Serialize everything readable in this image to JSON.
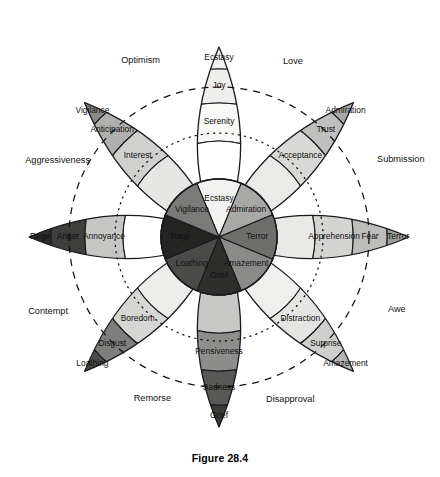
{
  "figure": {
    "caption": "Figure 28.4",
    "center": {
      "x": 219,
      "y": 237
    },
    "stroke_color": "#1a1a1a"
  },
  "palette": {
    "tip_white": "#ffffff",
    "joy_l1": "#f4f4f2",
    "joy_l2": "#eeeeec",
    "joy_l3": "#f2f2f0",
    "trust_l1": "#d8d8d6",
    "trust_l2": "#bfbfbd",
    "trust_l3": "#a8a8a6",
    "fear_l1": "#d4d4d2",
    "fear_l2": "#bdbdbb",
    "fear_l3": "#9c9c9a",
    "surprise_l1": "#e4e4e2",
    "surprise_l2": "#cfcfcd",
    "surprise_l3": "#b4b4b2",
    "sadness_l1": "#c8c8c6",
    "sadness_l2": "#8d8d8b",
    "sadness_l3": "#4f4f4d",
    "disgust_l1": "#e2e2e0",
    "disgust_l2": "#cccccb",
    "disgust_l3": "#7e7e7c",
    "anger_l1": "#c6c6c4",
    "anger_l2": "#3e3e3c",
    "anger_l3": "#2b2b29",
    "anticipation_l1": "#d0d0ce",
    "anticipation_l2": "#b0b0ae",
    "anticipation_l3": "#8a8a88"
  },
  "petals": [
    {
      "key": "joy",
      "angle_deg": -90,
      "primary": "Joy",
      "bands": [
        {
          "name": "Ecstasy",
          "level": 3,
          "color": "#f2f2f0",
          "text_color": "#111"
        },
        {
          "name": "Joy",
          "level": 2,
          "color": "#eeeeec",
          "text_color": "#111"
        },
        {
          "name": "Serenity",
          "level": 1,
          "color": "#f8f8f6",
          "text_color": "#111"
        },
        {
          "name": "",
          "level": 0,
          "color": "#ffffff",
          "text_color": "#111"
        }
      ]
    },
    {
      "key": "trust",
      "angle_deg": -45,
      "primary": "Trust",
      "bands": [
        {
          "name": "Admiration",
          "level": 3,
          "color": "#a8a8a6",
          "text_color": "#111"
        },
        {
          "name": "Trust",
          "level": 2,
          "color": "#bfbfbd",
          "text_color": "#111"
        },
        {
          "name": "Acceptance",
          "level": 1,
          "color": "#d8d8d6",
          "text_color": "#111"
        },
        {
          "name": "",
          "level": 0,
          "color": "#eaeae8",
          "text_color": "#111"
        }
      ]
    },
    {
      "key": "fear",
      "angle_deg": 0,
      "primary": "Fear",
      "bands": [
        {
          "name": "Terror",
          "level": 3,
          "color": "#9c9c9a",
          "text_color": "#111"
        },
        {
          "name": "Fear",
          "level": 2,
          "color": "#bdbdbb",
          "text_color": "#111"
        },
        {
          "name": "Apprehension",
          "level": 1,
          "color": "#d4d4d2",
          "text_color": "#111"
        },
        {
          "name": "",
          "level": 0,
          "color": "#e8e8e6",
          "text_color": "#111"
        }
      ]
    },
    {
      "key": "surprise",
      "angle_deg": 45,
      "primary": "Surprise",
      "bands": [
        {
          "name": "Amazement",
          "level": 3,
          "color": "#b4b4b2",
          "text_color": "#111"
        },
        {
          "name": "Surprise",
          "level": 2,
          "color": "#cfcfcd",
          "text_color": "#111"
        },
        {
          "name": "Distraction",
          "level": 1,
          "color": "#e4e4e2",
          "text_color": "#111"
        },
        {
          "name": "",
          "level": 0,
          "color": "#efefed",
          "text_color": "#111"
        }
      ]
    },
    {
      "key": "sadness",
      "angle_deg": 90,
      "primary": "Sadness",
      "bands": [
        {
          "name": "Grief",
          "level": 3,
          "color": "#3a3a38",
          "text_color": "#f0f0f0"
        },
        {
          "name": "Sadness",
          "level": 2,
          "color": "#585856",
          "text_color": "#f0f0f0"
        },
        {
          "name": "Pensiveness",
          "level": 1,
          "color": "#8d8d8b",
          "text_color": "#111"
        },
        {
          "name": "",
          "level": 0,
          "color": "#c8c8c6",
          "text_color": "#111"
        }
      ]
    },
    {
      "key": "disgust",
      "angle_deg": 135,
      "primary": "Disgust",
      "bands": [
        {
          "name": "Loathing",
          "level": 3,
          "color": "#4a4a48",
          "text_color": "#f0f0f0"
        },
        {
          "name": "Disgust",
          "level": 2,
          "color": "#7e7e7c",
          "text_color": "#111"
        },
        {
          "name": "Boredom",
          "level": 1,
          "color": "#d6d6d4",
          "text_color": "#111"
        },
        {
          "name": "",
          "level": 0,
          "color": "#ededeb",
          "text_color": "#111"
        }
      ]
    },
    {
      "key": "anger",
      "angle_deg": 180,
      "primary": "Anger",
      "bands": [
        {
          "name": "Rage",
          "level": 3,
          "color": "#2b2b29",
          "text_color": "#e8e8e8"
        },
        {
          "name": "Anger",
          "level": 2,
          "color": "#3e3e3c",
          "text_color": "#e8e8e8"
        },
        {
          "name": "Annoyance",
          "level": 1,
          "color": "#c6c6c4",
          "text_color": "#111"
        },
        {
          "name": "",
          "level": 0,
          "color": "#ffffff",
          "text_color": "#111"
        }
      ]
    },
    {
      "key": "anticipation",
      "angle_deg": -135,
      "primary": "Anticipation",
      "bands": [
        {
          "name": "Vigilance",
          "level": 3,
          "color": "#8a8a88",
          "text_color": "#111"
        },
        {
          "name": "Anticipation",
          "level": 2,
          "color": "#b0b0ae",
          "text_color": "#111"
        },
        {
          "name": "Interest",
          "level": 1,
          "color": "#d0d0ce",
          "text_color": "#111"
        },
        {
          "name": "",
          "level": 0,
          "color": "#e6e6e4",
          "text_color": "#111"
        }
      ]
    }
  ],
  "core_segments": [
    {
      "name": "Ecstasy",
      "angle_deg": -90,
      "color": "#f2f2f0",
      "text_color": "#111"
    },
    {
      "name": "Admiration",
      "angle_deg": -45,
      "color": "#a8a8a6",
      "text_color": "#111"
    },
    {
      "name": "Terror",
      "angle_deg": 0,
      "color": "#6e6e6c",
      "text_color": "#f0f0f0"
    },
    {
      "name": "Amazement",
      "angle_deg": 45,
      "color": "#8a8a88",
      "text_color": "#111"
    },
    {
      "name": "Grief",
      "angle_deg": 90,
      "color": "#2e2e2c",
      "text_color": "#f0f0f0"
    },
    {
      "name": "Loathing",
      "angle_deg": 135,
      "color": "#4a4a48",
      "text_color": "#f0f0f0"
    },
    {
      "name": "Rage",
      "angle_deg": 180,
      "color": "#242422",
      "text_color": "#e8e8e8"
    },
    {
      "name": "Vigilance",
      "angle_deg": -135,
      "color": "#7a7a78",
      "text_color": "#111"
    }
  ],
  "dyads": [
    {
      "name": "Optimism",
      "angle_deg": -112.5,
      "x": 160,
      "y": 61,
      "anchor": "end"
    },
    {
      "name": "Love",
      "angle_deg": -67.5,
      "x": 283,
      "y": 62,
      "anchor": "start"
    },
    {
      "name": "Submission",
      "angle_deg": -22.5,
      "x": 377,
      "y": 160,
      "anchor": "start"
    },
    {
      "name": "Awe",
      "angle_deg": 22.5,
      "x": 388,
      "y": 310,
      "anchor": "start"
    },
    {
      "name": "Disapproval",
      "angle_deg": 67.5,
      "x": 266,
      "y": 400,
      "anchor": "start"
    },
    {
      "name": "Remorse",
      "angle_deg": 112.5,
      "x": 171,
      "y": 399,
      "anchor": "end"
    },
    {
      "name": "Contempt",
      "angle_deg": 157.5,
      "x": 68,
      "y": 312,
      "anchor": "end"
    },
    {
      "name": "Aggressiveness",
      "angle_deg": 202.5,
      "x": 90,
      "y": 161,
      "anchor": "end"
    }
  ],
  "guide_circles": [
    {
      "key": "outer-dyad-circle",
      "radius": 150,
      "dash": "7 6",
      "note": "long dashed ring through dyad labels"
    },
    {
      "key": "inner-dyad-circle",
      "radius": 104,
      "dash": "2.2 4",
      "note": "dotted ring inside petals"
    }
  ]
}
